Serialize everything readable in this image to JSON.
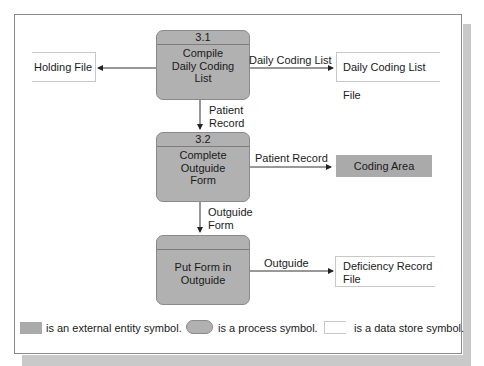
{
  "processes": [
    {
      "id": "3.1",
      "label": "Compile Daily Coding List",
      "lines": [
        "Compile",
        "Daily Coding",
        "List"
      ]
    },
    {
      "id": "3.2",
      "label": "Complete Outguide Form",
      "lines": [
        "Complete",
        "Outguide",
        "Form"
      ]
    },
    {
      "id": "",
      "label": "Put Form in Outguide",
      "lines": [
        "Put Form in",
        "Outguide"
      ]
    }
  ],
  "data_stores": {
    "holding_file": "Holding File",
    "daily_coding_list_file": "Daily Coding List File",
    "deficiency_record_file": [
      "Deficiency Record",
      "File"
    ]
  },
  "external_entities": {
    "coding_area": "Coding Area"
  },
  "flows": {
    "daily_coding_list": "Daily Coding List",
    "patient_record_down": [
      "Patient",
      "Record"
    ],
    "patient_record_right": "Patient Record",
    "outguide_form": [
      "Outguide",
      "Form"
    ],
    "outguide": "Outguide"
  },
  "legend": {
    "entity": "is an external entity symbol.",
    "process": "is a process symbol.",
    "store": "is a data store symbol."
  },
  "colors": {
    "process_fill": "#b1b1b1",
    "entity_fill": "#aaaaaa",
    "shadow": "#c9c9c9"
  }
}
